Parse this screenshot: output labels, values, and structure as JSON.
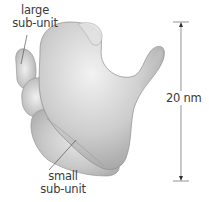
{
  "figure": {
    "labels": {
      "large_subunit": {
        "line1": "large",
        "line2": "sub-unit"
      },
      "small_subunit": {
        "line1": "small",
        "line2": "sub-unit"
      }
    },
    "scale_bar": {
      "label": "20 nm",
      "value": 20,
      "unit": "nm"
    }
  },
  "colors": {
    "body_light": "#e6e6e6",
    "body_mid": "#c4c4c4",
    "body_dark": "#9a9a9a",
    "line": "#555555",
    "text": "#3a3a3a",
    "background": "#ffffff"
  }
}
